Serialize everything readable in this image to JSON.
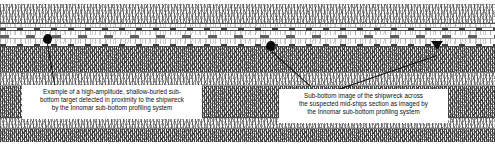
{
  "figure": {
    "type": "sub-bottom-profiler-sonogram"
  },
  "annotations": {
    "left_callout": {
      "lines": [
        "Example of a  high-amplitude, shallow-buried sub-",
        "bottom target detected in proximity to the shipwreck",
        "by the Innomar sub-bottom profiling system"
      ],
      "marker": "blob-marker"
    },
    "right_callout": {
      "lines": [
        "Sub-bottom image of the shipwreck across",
        "the suspected mid-ships section as imaged by",
        "the Innomar sub-bottom profiling system"
      ],
      "markers": [
        "blob-marker",
        "arrowhead-marker"
      ]
    }
  },
  "colors": {
    "background": "#ffffff",
    "record_ink": "#2b2b2b",
    "annotation_ink": "#0b0b0b",
    "caption_text": "#111111"
  }
}
